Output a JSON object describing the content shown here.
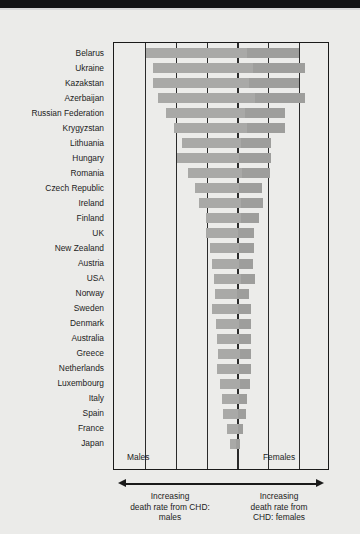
{
  "figure": {
    "background_color": "#ebebe9",
    "bar_color": "#a9a9a7",
    "frame_color": "#1a1a1a"
  },
  "axis": {
    "left_label": "Males",
    "right_label": "Females",
    "left_caption": "Increasing\ndeath rate from CHD:\nmales",
    "left_caption_lines": [
      "Increasing",
      "death rate from CHD:",
      "males"
    ],
    "right_caption_lines": [
      "Increasing",
      "death rate from",
      "CHD: females"
    ]
  },
  "chart_data": {
    "type": "bar",
    "title": "",
    "subtitle": "",
    "xlabel": "Increasing death rate from CHD",
    "ylabel": "",
    "orientation": "horizontal",
    "bar_style": "floating / range bar (start and end)",
    "grid": true,
    "gridlines_x": [
      0,
      1,
      2,
      3,
      4,
      5,
      6,
      7
    ],
    "legend_position": "in-plot",
    "legend": [
      "Males",
      "Females"
    ],
    "xlim": [
      0,
      7
    ],
    "note": "Each bar spans from the male death-rate value (left end) to the female death-rate value (right end) on an arbitrary increasing scale of 0-7 grid units.",
    "categories": [
      "Belarus",
      "Ukraine",
      "Kazakstan",
      "Azerbaijan",
      "Russian Federation",
      "Krygyzstan",
      "Lithuania",
      "Hungary",
      "Romania",
      "Czech Republic",
      "Ireland",
      "Finland",
      "UK",
      "New Zealand",
      "Austria",
      "USA",
      "Norway",
      "Sweden",
      "Denmark",
      "Australia",
      "Greece",
      "Netherlands",
      "Luxembourg",
      "Italy",
      "Spain",
      "France",
      "Japan"
    ],
    "series": [
      {
        "name": "bar start (males axis position)",
        "values": [
          1.08,
          1.3,
          1.3,
          1.45,
          1.72,
          1.98,
          2.22,
          2.06,
          2.42,
          2.66,
          2.8,
          3.0,
          3.02,
          3.14,
          3.2,
          3.26,
          3.3,
          3.2,
          3.34,
          3.36,
          3.4,
          3.36,
          3.46,
          3.54,
          3.56,
          3.68,
          3.8
        ]
      },
      {
        "name": "bar end (females axis position)",
        "values": [
          6.02,
          6.22,
          6.02,
          6.22,
          5.58,
          5.58,
          5.12,
          5.12,
          5.1,
          4.84,
          4.86,
          4.74,
          4.58,
          4.56,
          4.54,
          4.6,
          4.4,
          4.48,
          4.46,
          4.46,
          4.48,
          4.46,
          4.44,
          4.34,
          4.32,
          4.22,
          4.1
        ]
      }
    ],
    "bars": [
      {
        "country": "Belarus",
        "start": 1.08,
        "end": 6.02
      },
      {
        "country": "Ukraine",
        "start": 1.3,
        "end": 6.22
      },
      {
        "country": "Kazakstan",
        "start": 1.3,
        "end": 6.02
      },
      {
        "country": "Azerbaijan",
        "start": 1.45,
        "end": 6.22
      },
      {
        "country": "Russian Federation",
        "start": 1.72,
        "end": 5.58
      },
      {
        "country": "Krygyzstan",
        "start": 1.98,
        "end": 5.58
      },
      {
        "country": "Lithuania",
        "start": 2.22,
        "end": 5.12
      },
      {
        "country": "Hungary",
        "start": 2.06,
        "end": 5.12
      },
      {
        "country": "Romania",
        "start": 2.42,
        "end": 5.1
      },
      {
        "country": "Czech Republic",
        "start": 2.66,
        "end": 4.84
      },
      {
        "country": "Ireland",
        "start": 2.8,
        "end": 4.86
      },
      {
        "country": "Finland",
        "start": 3.0,
        "end": 4.74
      },
      {
        "country": "UK",
        "start": 3.02,
        "end": 4.58
      },
      {
        "country": "New Zealand",
        "start": 3.14,
        "end": 4.56
      },
      {
        "country": "Austria",
        "start": 3.2,
        "end": 4.54
      },
      {
        "country": "USA",
        "start": 3.26,
        "end": 4.6
      },
      {
        "country": "Norway",
        "start": 3.3,
        "end": 4.4
      },
      {
        "country": "Sweden",
        "start": 3.2,
        "end": 4.48
      },
      {
        "country": "Denmark",
        "start": 3.34,
        "end": 4.46
      },
      {
        "country": "Australia",
        "start": 3.36,
        "end": 4.46
      },
      {
        "country": "Greece",
        "start": 3.4,
        "end": 4.48
      },
      {
        "country": "Netherlands",
        "start": 3.36,
        "end": 4.46
      },
      {
        "country": "Luxembourg",
        "start": 3.46,
        "end": 4.44
      },
      {
        "country": "Italy",
        "start": 3.54,
        "end": 4.34
      },
      {
        "country": "Spain",
        "start": 3.56,
        "end": 4.32
      },
      {
        "country": "France",
        "start": 3.68,
        "end": 4.22
      },
      {
        "country": "Japan",
        "start": 3.8,
        "end": 4.1
      }
    ]
  }
}
